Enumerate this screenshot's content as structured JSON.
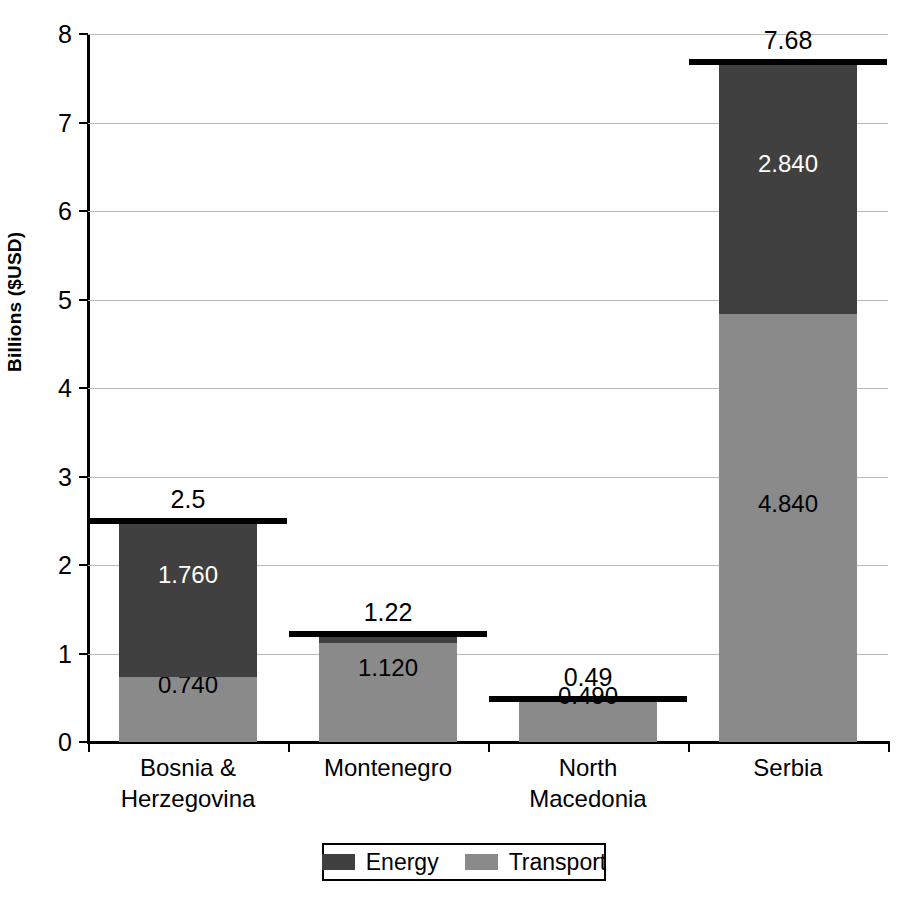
{
  "chart_data": {
    "type": "bar",
    "subtype": "stacked-vertical",
    "title": "",
    "xlabel": "",
    "ylabel": "Billions ($USD)",
    "ylim": [
      0,
      8
    ],
    "ytick_values": [
      0,
      1,
      2,
      3,
      4,
      5,
      6,
      7,
      8
    ],
    "ytick_labels": [
      "0",
      "1",
      "2",
      "3",
      "4",
      "5",
      "6",
      "7",
      "8"
    ],
    "grid": true,
    "grid_axis": "y",
    "legend_position": "bottom",
    "categories": [
      "Bosnia & Herzegovina",
      "Montenegro",
      "North Macedonia",
      "Serbia"
    ],
    "category_label_lines": [
      [
        "Bosnia &",
        "Herzegovina"
      ],
      [
        "Montenegro"
      ],
      [
        "North",
        "Macedonia"
      ],
      [
        "Serbia"
      ]
    ],
    "series": [
      {
        "name": "Energy",
        "color": "#404040",
        "values": [
          1.76,
          0.1,
          0.0,
          2.84
        ],
        "labels": [
          "1.760",
          "",
          "",
          "2.840"
        ],
        "label_colors": [
          "#ffffff",
          "",
          "",
          "#ffffff"
        ]
      },
      {
        "name": "Transport",
        "color": "#8a8a8a",
        "values": [
          0.74,
          1.12,
          0.49,
          4.84
        ],
        "labels": [
          "0.740",
          "1.120",
          "0.490",
          "4.840"
        ],
        "label_colors": [
          "#000000",
          "#000000",
          "#000000",
          "#000000"
        ]
      }
    ],
    "totals": [
      2.5,
      1.22,
      0.49,
      7.68
    ],
    "total_labels": [
      "2.5",
      "1.22",
      "0.49",
      "7.68"
    ]
  },
  "legend": {
    "items": [
      {
        "label": "Energy",
        "color": "#404040"
      },
      {
        "label": "Transport",
        "color": "#8a8a8a"
      }
    ]
  },
  "axis": {
    "y_title": "Billions ($USD)"
  }
}
